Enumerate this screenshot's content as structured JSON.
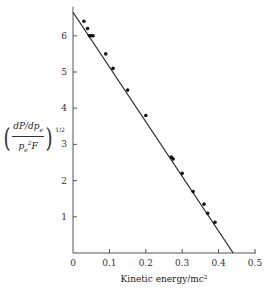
{
  "chart_data": {
    "type": "scatter",
    "title": "",
    "xlabel": "Kinetic energy/mc²",
    "ylabel": "(dP/dp_e / p_e²F)^(1/2)",
    "ylabel_parts": {
      "numerator": "dP/dp",
      "numerator_sub": "e",
      "denominator": "p",
      "denominator_sub": "e",
      "denominator_sup": "2",
      "denominator_tail": "F",
      "exponent": "1/2"
    },
    "xlim": [
      0,
      0.5
    ],
    "ylim": [
      0,
      6.8
    ],
    "xticks": [
      0,
      0.1,
      0.2,
      0.3,
      0.4,
      0.5
    ],
    "xtick_labels": [
      "0",
      "0.1",
      "0.2",
      "0.3",
      "0.4",
      "0.5"
    ],
    "yticks": [
      1,
      2,
      3,
      4,
      5,
      6
    ],
    "ytick_labels": [
      "1",
      "2",
      "3",
      "4",
      "5",
      "6"
    ],
    "grid": false,
    "legend": null,
    "series": [
      {
        "name": "measured points",
        "kind": "scatter",
        "x": [
          0.03,
          0.04,
          0.045,
          0.05,
          0.055,
          0.09,
          0.11,
          0.15,
          0.2,
          0.27,
          0.275,
          0.3,
          0.33,
          0.36,
          0.37,
          0.39
        ],
        "y": [
          6.4,
          6.2,
          6.0,
          6.0,
          6.0,
          5.5,
          5.1,
          4.5,
          3.8,
          2.65,
          2.6,
          2.2,
          1.7,
          1.35,
          1.1,
          0.85
        ]
      },
      {
        "name": "linear fit",
        "kind": "line",
        "x": [
          0,
          0.44
        ],
        "y": [
          6.65,
          0
        ]
      }
    ],
    "colors": {
      "axis": "#555555",
      "line": "#222222",
      "points": "#111111",
      "text": "#333333"
    }
  }
}
